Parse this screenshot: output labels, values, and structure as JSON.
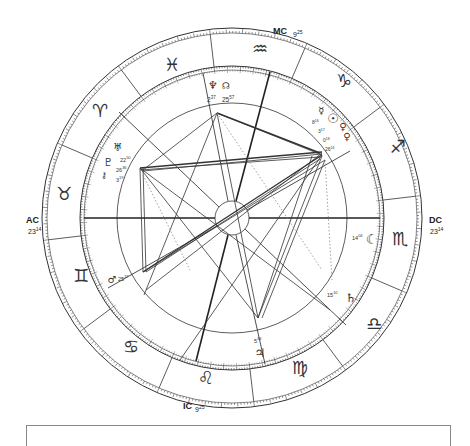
{
  "chart_data": {
    "type": "natal-chart-wheel",
    "center": [
      232,
      218
    ],
    "angles": {
      "AC": {
        "label": "AC",
        "degree": "23",
        "minute": "14",
        "sign": "cancer"
      },
      "DC": {
        "label": "DC",
        "degree": "23",
        "minute": "14",
        "sign": "capricorn"
      },
      "MC": {
        "label": "MC",
        "degree": "9",
        "minute": "25",
        "sign": "aquarius"
      },
      "IC": {
        "label": "IC",
        "degree": "9",
        "minute": "25",
        "sign": "leo"
      }
    },
    "zodiac_signs": [
      {
        "name": "aquarius",
        "glyph": "♒"
      },
      {
        "name": "capricorn",
        "glyph": "♑"
      },
      {
        "name": "sagittarius",
        "glyph": "♐"
      },
      {
        "name": "scorpio",
        "glyph": "♏"
      },
      {
        "name": "libra",
        "glyph": "♎"
      },
      {
        "name": "virgo",
        "glyph": "♍"
      },
      {
        "name": "leo",
        "glyph": "♌"
      },
      {
        "name": "cancer",
        "glyph": "♋"
      },
      {
        "name": "gemini",
        "glyph": "♊"
      },
      {
        "name": "taurus",
        "glyph": "♉"
      },
      {
        "name": "aries",
        "glyph": "♈"
      },
      {
        "name": "pisces",
        "glyph": "♓"
      }
    ],
    "planets": [
      {
        "name": "neptune",
        "glyph": "♆",
        "degree": "2",
        "minute": "37"
      },
      {
        "name": "north-node",
        "glyph": "☊",
        "degree": "25",
        "minute": "57"
      },
      {
        "name": "mercury",
        "glyph": "☿",
        "degree": "8",
        "minute": "16"
      },
      {
        "name": "sun",
        "glyph": "☉",
        "degree": "3",
        "minute": "17"
      },
      {
        "name": "venus",
        "glyph": "♀",
        "degree": "0",
        "minute": "18"
      },
      {
        "name": "mars-cluster",
        "glyph": "♀",
        "degree": "26",
        "minute": "16"
      },
      {
        "name": "uranus",
        "glyph": "♅",
        "degree": "22",
        "minute": "50"
      },
      {
        "name": "pluto",
        "glyph": "♇",
        "degree": "26",
        "minute": "36"
      },
      {
        "name": "chiron",
        "glyph": "⚷",
        "degree": "3",
        "minute": "19"
      },
      {
        "name": "mars",
        "glyph": "♂",
        "degree": "25",
        "minute": "37"
      },
      {
        "name": "moon",
        "glyph": "☾",
        "degree": "14",
        "minute": "04"
      },
      {
        "name": "saturn",
        "glyph": "♄",
        "degree": "15",
        "minute": "10"
      },
      {
        "name": "jupiter",
        "glyph": "♃",
        "degree": "5",
        "minute": "34"
      }
    ]
  },
  "labels": {
    "ac": "AC",
    "ac_deg": "23",
    "ac_min": "14",
    "dc": "DC",
    "dc_deg": "23",
    "dc_min": "14",
    "mc": "MC",
    "mc_deg": "9",
    "mc_min": "25",
    "ic": "IC",
    "ic_deg": "9",
    "ic_min": "25"
  },
  "signs": {
    "aquarius": "♒",
    "capricorn": "♑",
    "sagittarius": "♐",
    "scorpio": "♏",
    "libra": "♎",
    "virgo": "♍",
    "leo": "♌",
    "cancer": "♋",
    "gemini": "♊",
    "taurus": "♉",
    "aries": "♈",
    "pisces": "♓"
  },
  "planets": {
    "neptune": {
      "glyph": "♆",
      "pos": "2",
      "min": "37"
    },
    "node": {
      "glyph": "☊",
      "pos": "25",
      "min": "57"
    },
    "mercury": {
      "glyph": "☿",
      "pos": "8",
      "min": "16"
    },
    "sun": {
      "glyph": "☉",
      "pos": "3",
      "min": "17"
    },
    "venus": {
      "glyph": "♀",
      "pos": "0",
      "min": "18"
    },
    "venus2": {
      "glyph": "♀",
      "pos": "26",
      "min": "16"
    },
    "uranus": {
      "glyph": "♅",
      "pos": "22",
      "min": "50"
    },
    "pluto": {
      "glyph": "♇",
      "pos": "26",
      "min": "36"
    },
    "chiron": {
      "glyph": "⚷",
      "pos": "3",
      "min": "19"
    },
    "mars": {
      "glyph": "♂",
      "pos": "25",
      "min": "37"
    },
    "moon": {
      "glyph": "☾",
      "pos": "14",
      "min": "04"
    },
    "saturn": {
      "glyph": "♄",
      "pos": "15",
      "min": "10"
    },
    "jupiter": {
      "glyph": "♃",
      "pos": "5",
      "min": "34"
    }
  }
}
